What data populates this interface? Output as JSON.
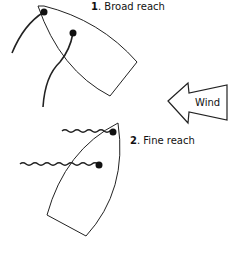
{
  "colors": {
    "stroke": "#222222",
    "background": "#ffffff",
    "dot": "#111111"
  },
  "boats": [
    {
      "number": "1",
      "label": ". Broad reach"
    },
    {
      "number": "2",
      "label": ". Fine reach"
    }
  ],
  "wind": {
    "label": "Wind",
    "icon": "arrow-left-icon"
  }
}
